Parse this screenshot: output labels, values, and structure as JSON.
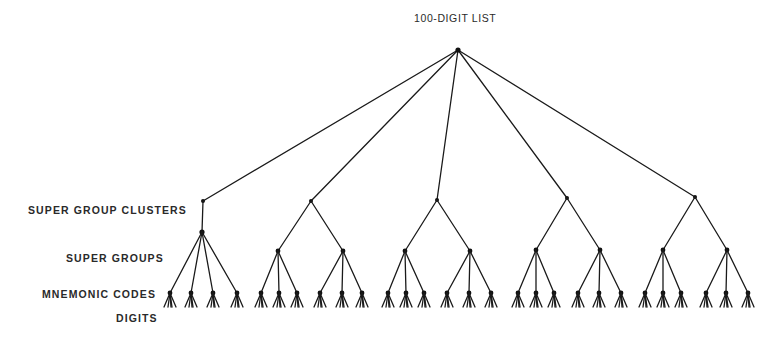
{
  "diagram": {
    "title": "100-DIGIT LIST",
    "level_labels": {
      "clusters": "SUPER GROUP CLUSTERS",
      "super_groups": "SUPER GROUPS",
      "mnemonic_codes": "MNEMONIC CODES",
      "digits": "DIGITS"
    },
    "colors": {
      "line": "#1a1a1a",
      "text": "#2a2a2a",
      "background": "#ffffff"
    },
    "root": {
      "x": 458,
      "y": 50
    },
    "digit_fan": {
      "count": 4,
      "spread": 12,
      "drop": 14
    },
    "clusters": [
      {
        "x": 203,
        "y": 201,
        "stem": {
          "x": 202,
          "y": 232
        },
        "super_groups": [],
        "mnemonics": [
          170,
          191,
          213,
          237
        ]
      },
      {
        "x": 311,
        "y": 201,
        "super_groups": [
          {
            "x": 278,
            "y": 251,
            "mnemonics": [
              261,
              279,
              297
            ]
          },
          {
            "x": 343,
            "y": 251,
            "mnemonics": [
              320,
              342,
              362
            ]
          }
        ]
      },
      {
        "x": 437,
        "y": 200,
        "super_groups": [
          {
            "x": 405,
            "y": 251,
            "mnemonics": [
              388,
              406,
              424
            ]
          },
          {
            "x": 470,
            "y": 251,
            "mnemonics": [
              447,
              469,
              491
            ]
          }
        ]
      },
      {
        "x": 567,
        "y": 198,
        "super_groups": [
          {
            "x": 536,
            "y": 250,
            "mnemonics": [
              518,
              536,
              554
            ]
          },
          {
            "x": 600,
            "y": 250,
            "mnemonics": [
              578,
              599,
              621
            ]
          }
        ]
      },
      {
        "x": 695,
        "y": 197,
        "super_groups": [
          {
            "x": 663,
            "y": 250,
            "mnemonics": [
              645,
              663,
              681
            ]
          },
          {
            "x": 727,
            "y": 250,
            "mnemonics": [
              706,
              726,
              748
            ]
          }
        ]
      }
    ],
    "mnemonic_y": 293
  }
}
